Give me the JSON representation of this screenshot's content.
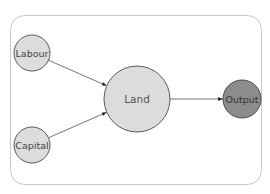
{
  "caption_fragment": "g",
  "diagram": {
    "container": {
      "border_color": "#c8c8c8",
      "fill": "#ffffff"
    },
    "nodes": [
      {
        "id": "labour",
        "label": "Labour",
        "fill": "#dcdcdc",
        "stroke": "#4a4a4a"
      },
      {
        "id": "capital",
        "label": "Capital",
        "fill": "#dcdcdc",
        "stroke": "#4a4a4a"
      },
      {
        "id": "land",
        "label": "Land",
        "fill": "#dcdcdc",
        "stroke": "#4a4a4a"
      },
      {
        "id": "output",
        "label": "Output",
        "fill": "#8c8c8c",
        "stroke": "#3a3a3a"
      }
    ],
    "edges": [
      {
        "from": "labour",
        "to": "land"
      },
      {
        "from": "capital",
        "to": "land"
      },
      {
        "from": "land",
        "to": "output"
      }
    ]
  }
}
